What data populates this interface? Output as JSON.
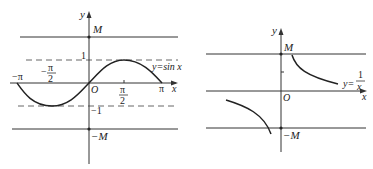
{
  "left_graph": {
    "function_label": "y=sin x",
    "y_axis_label": "y",
    "x_axis_label": "x",
    "origin_label": "O",
    "upper_bound_label": "M",
    "lower_bound_label": "−M",
    "dashed_upper_label": "1",
    "dashed_lower_label": "−1",
    "tick_neg_pi": "−π",
    "tick_neg_half_pi_num": "π",
    "tick_neg_half_pi_den": "2",
    "tick_neg_half_pi_sign": "−",
    "tick_half_pi_num": "π",
    "tick_half_pi_den": "2",
    "tick_pi": "π"
  },
  "right_graph": {
    "function_label_prefix": "y=",
    "function_label_num": "1",
    "function_label_den": "x",
    "y_axis_label": "y",
    "x_axis_label": "x",
    "origin_label": "O",
    "upper_bound_label": "M",
    "lower_bound_label": "−M"
  },
  "colors": {
    "stroke": "#222222",
    "axis": "#333333",
    "dashed": "#555555"
  }
}
